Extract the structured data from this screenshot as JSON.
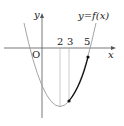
{
  "diagram": {
    "type": "function-graph",
    "function_label": "y=f(x)",
    "axes": {
      "x_label": "x",
      "y_label": "y",
      "origin_label": "O"
    },
    "tick_labels": [
      "2",
      "3",
      "5"
    ],
    "curve": {
      "shape": "upward parabola",
      "vertex_x": 2,
      "highlighted_interval": [
        3,
        5
      ]
    },
    "colors": {
      "curve": "#9a9a9a",
      "highlight": "#111111",
      "axis": "#555555",
      "guide": "#aaaaaa"
    }
  }
}
